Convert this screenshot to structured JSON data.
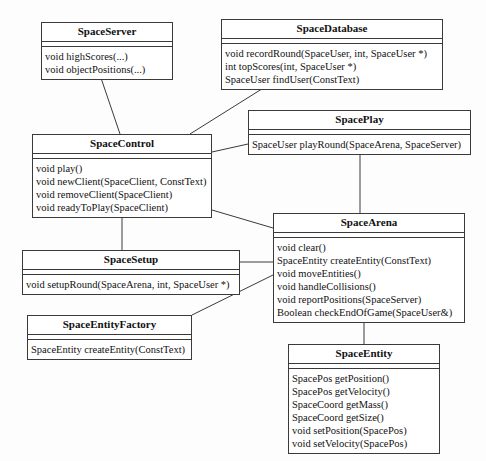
{
  "diagram": {
    "type": "uml-class-diagram",
    "line_color": "#3a3a3a",
    "background": "#fdfdfd",
    "classes": [
      {
        "id": "space-server",
        "name": "SpaceServer",
        "x": 41,
        "y": 22,
        "width": 132,
        "height": 53,
        "attributes": [],
        "methods": [
          "void highScores(...)",
          "void objectPositions(...)"
        ]
      },
      {
        "id": "space-database",
        "name": "SpaceDatabase",
        "x": 221,
        "y": 19,
        "width": 222,
        "height": 68,
        "attributes": [],
        "methods": [
          "void recordRound(SpaceUser, int, SpaceUser *)",
          "int topScores(int, SpaceUser *)",
          "SpaceUser findUser(ConstText)"
        ]
      },
      {
        "id": "space-play",
        "name": "SpacePlay",
        "x": 248,
        "y": 110,
        "width": 223,
        "height": 42,
        "attributes": [],
        "methods": [
          "SpaceUser playRound(SpaceArena, SpaceServer)"
        ]
      },
      {
        "id": "space-control",
        "name": "SpaceControl",
        "x": 32,
        "y": 134,
        "width": 180,
        "height": 76,
        "attributes": [],
        "methods": [
          "void play()",
          "void newClient(SpaceClient, ConstText)",
          "void removeClient(SpaceClient)",
          "void readyToPlay(SpaceClient)"
        ]
      },
      {
        "id": "space-arena",
        "name": "SpaceArena",
        "x": 273,
        "y": 213,
        "width": 192,
        "height": 90,
        "attributes": [],
        "methods": [
          "void clear()",
          "SpaceEntity createEntity(ConstText)",
          "void moveEntities()",
          "void handleCollisions()",
          "void reportPositions(SpaceServer)",
          "Boolean checkEndOfGame(SpaceUser&)"
        ]
      },
      {
        "id": "space-setup",
        "name": "SpaceSetup",
        "x": 22,
        "y": 250,
        "width": 218,
        "height": 42,
        "attributes": [],
        "methods": [
          "void setupRound(SpaceArena, int, SpaceUser *)"
        ]
      },
      {
        "id": "space-entity-factory",
        "name": "SpaceEntityFactory",
        "x": 27,
        "y": 315,
        "width": 165,
        "height": 42,
        "attributes": [],
        "methods": [
          "SpaceEntity createEntity(ConstText)"
        ]
      },
      {
        "id": "space-entity",
        "name": "SpaceEntity",
        "x": 288,
        "y": 344,
        "width": 152,
        "height": 101,
        "attributes": [],
        "methods": [
          "SpacePos getPosition()",
          "SpacePos getVelocity()",
          "SpaceCoord getMass()",
          "SpaceCoord getSize()",
          "void setPosition(SpacePos)",
          "void setVelocity(SpacePos)"
        ]
      }
    ],
    "relationships": [
      {
        "id": "server-control",
        "from": "space-server",
        "to": "space-control",
        "kind": "association",
        "points": "100,75 120,134"
      },
      {
        "id": "database-control",
        "from": "space-database",
        "to": "space-control",
        "kind": "association",
        "points": "265,87 190,134"
      },
      {
        "id": "control-play",
        "from": "space-control",
        "to": "space-play",
        "kind": "association",
        "points": "212,152 248,144"
      },
      {
        "id": "play-arena",
        "from": "space-play",
        "to": "space-arena",
        "kind": "association",
        "points": "360,152 360,213"
      },
      {
        "id": "control-arena",
        "from": "space-control",
        "to": "space-arena",
        "kind": "association",
        "points": "212,210 273,228"
      },
      {
        "id": "control-setup",
        "from": "space-control",
        "to": "space-setup",
        "kind": "association",
        "points": "122,210 122,250"
      },
      {
        "id": "setup-arena",
        "from": "space-setup",
        "to": "space-arena",
        "kind": "association",
        "points": "240,262 273,262"
      },
      {
        "id": "arena-factory",
        "from": "space-arena",
        "to": "space-entity-factory",
        "kind": "association",
        "points": "273,275 192,315"
      },
      {
        "id": "arena-entity",
        "from": "space-arena",
        "to": "space-entity",
        "kind": "aggregation",
        "points": "364,303 364,344",
        "diamond_at": "364,311"
      }
    ]
  }
}
